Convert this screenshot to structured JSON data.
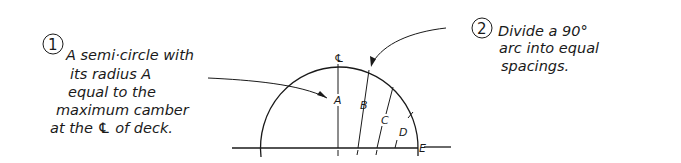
{
  "diagram": {
    "note1": {
      "number": "1",
      "lines": [
        "A semi·circle with",
        "its radius A",
        "equal to the",
        "maximum camber",
        "at the ℄ of deck."
      ]
    },
    "note2": {
      "number": "2",
      "lines": [
        "Divide a 90°",
        "arc into equal",
        "spacings."
      ]
    },
    "centerline_symbol": "℄",
    "ordinate_labels": [
      "A",
      "B",
      "C",
      "D",
      "E"
    ],
    "arc_divisions": 4,
    "arc_span_degrees": 90,
    "colors": {
      "ink": "#1a1a1a",
      "background": "#ffffff"
    }
  }
}
